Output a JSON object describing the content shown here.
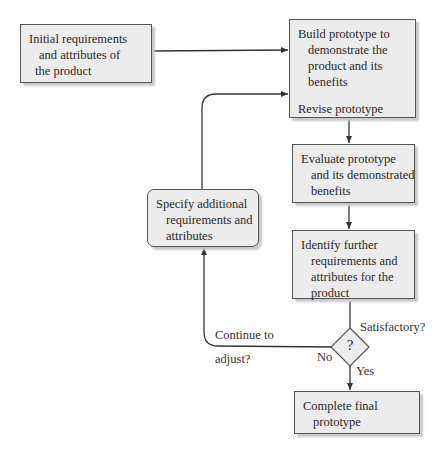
{
  "nodes": {
    "initial": {
      "lines": [
        "Initial requirements",
        "and attributes of",
        "the product"
      ]
    },
    "build": {
      "lines": [
        "Build prototype to",
        "demonstrate the",
        "product and its",
        "benefits"
      ],
      "revise": "Revise prototype"
    },
    "evaluate": {
      "lines": [
        "Evaluate prototype",
        "and its demonstrated",
        "benefits"
      ]
    },
    "identify": {
      "lines": [
        "Identify further",
        "requirements and",
        "attributes for the",
        "product"
      ]
    },
    "specify": {
      "lines": [
        "Specify additional",
        "requirements and",
        "attributes"
      ]
    },
    "decision": {
      "symbol": "?",
      "question": "Satisfactory?"
    },
    "complete": {
      "lines": [
        "Complete final",
        "prototype"
      ]
    }
  },
  "edge_labels": {
    "continue_1": "Continue to",
    "continue_2": "adjust?",
    "no": "No",
    "yes": "Yes"
  },
  "colors": {
    "box_fill": "#ececec",
    "border": "#555555",
    "line": "#333333"
  }
}
